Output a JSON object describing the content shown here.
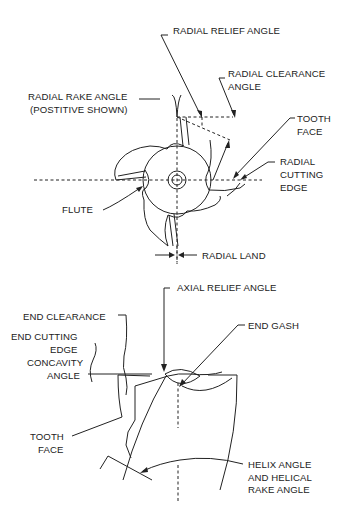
{
  "diagram": {
    "colors": {
      "line": "#222222",
      "background": "#ffffff"
    },
    "radial_view": {
      "labels": {
        "radial_relief_angle": "RADIAL RELIEF ANGLE",
        "radial_clearance_angle_1": "RADIAL CLEARANCE",
        "radial_clearance_angle_2": "ANGLE",
        "radial_rake_angle_1": "RADIAL RAKE ANGLE",
        "radial_rake_angle_2": "(POSTITIVE SHOWN)",
        "tooth_face_1": "TOOTH",
        "tooth_face_2": "FACE",
        "radial_cutting_edge_1": "RADIAL",
        "radial_cutting_edge_2": "CUTTING",
        "radial_cutting_edge_3": "EDGE",
        "flute": "FLUTE",
        "radial_land": "RADIAL LAND"
      }
    },
    "axial_view": {
      "labels": {
        "axial_relief_angle": "AXIAL RELIEF ANGLE",
        "end_clearance": "END CLEARANCE",
        "end_gash": "END GASH",
        "end_cutting_edge_concavity_1": "END CUTTING",
        "end_cutting_edge_concavity_2": "EDGE",
        "end_cutting_edge_concavity_3": "CONCAVITY",
        "end_cutting_edge_concavity_4": "ANGLE",
        "tooth_face_1": "TOOTH",
        "tooth_face_2": "FACE",
        "helix_angle_1": "HELIX ANGLE",
        "helix_angle_2": "AND HELICAL",
        "helix_angle_3": "RAKE ANGLE"
      }
    }
  }
}
